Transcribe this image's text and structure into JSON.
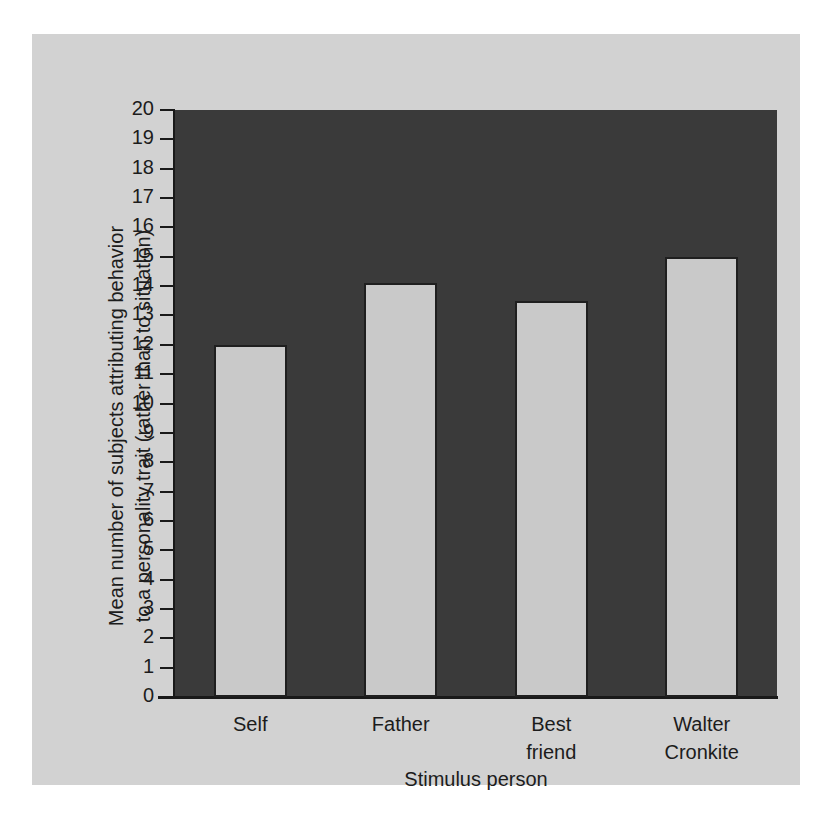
{
  "figure": {
    "background_color": "#ffffff",
    "panel_color": "#d2d2d2",
    "plot_background_color": "#3a3a3a",
    "bar_fill_color": "#c9c9c9",
    "bar_edge_color": "#1f1f1f",
    "axis_color": "#191919",
    "text_color": "#1c1c1c"
  },
  "chart_data": {
    "type": "bar",
    "title": "",
    "xlabel": "Stimulus person",
    "ylabel": "Mean number of subjects attributing behavior to a personality trait (rather than to situation)",
    "ylabel_line1": "Mean number of subjects attributing behavior",
    "ylabel_line2": "to a personality trait (rather than to situation)",
    "categories": [
      "Self",
      "Father",
      "Best friend",
      "Walter Cronkite"
    ],
    "category_lines": [
      [
        "Self"
      ],
      [
        "Father"
      ],
      [
        "Best",
        "friend"
      ],
      [
        "Walter",
        "Cronkite"
      ]
    ],
    "values": [
      12.0,
      14.1,
      13.5,
      15.0
    ],
    "ylim": [
      0,
      20
    ],
    "ytick_step": 1,
    "yticks": [
      20,
      19,
      18,
      17,
      16,
      15,
      14,
      13,
      12,
      11,
      10,
      9,
      8,
      7,
      6,
      5,
      4,
      3,
      2,
      1,
      0
    ],
    "ytick_labels": [
      "20",
      "19",
      "18",
      "17",
      "16",
      "15",
      "14",
      "13",
      "12",
      "11",
      "10",
      "9",
      "8",
      "7",
      "6",
      "5",
      "4",
      "3",
      "2",
      "1",
      "0"
    ],
    "grid": false,
    "legend": null,
    "legend_position": "none"
  }
}
